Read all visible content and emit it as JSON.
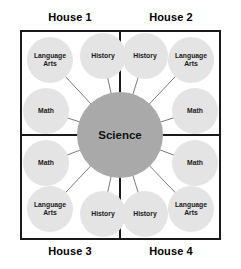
{
  "diagram": {
    "center": {
      "label": "Science",
      "color": "#a9a9a9"
    },
    "satellite_color": "#e4e4e4",
    "border_color": "#1a1a1a",
    "quadrant_labels": {
      "top_left": "House 1",
      "top_right": "House 2",
      "bottom_left": "House 3",
      "bottom_right": "House 4"
    },
    "nodes": [
      {
        "label": "Language Arts",
        "line1": "Language",
        "line2": "Arts",
        "quadrant": "House 1",
        "x": 27,
        "y": 37
      },
      {
        "label": "History",
        "line1": "History",
        "line2": "",
        "quadrant": "House 1",
        "x": 80,
        "y": 33
      },
      {
        "label": "Math",
        "line1": "Math",
        "line2": "",
        "quadrant": "House 1",
        "x": 23,
        "y": 88
      },
      {
        "label": "History",
        "line1": "History",
        "line2": "",
        "quadrant": "House 2",
        "x": 122,
        "y": 33
      },
      {
        "label": "Language Arts",
        "line1": "Language",
        "line2": "Arts",
        "quadrant": "House 2",
        "x": 168,
        "y": 37
      },
      {
        "label": "Math",
        "line1": "Math",
        "line2": "",
        "quadrant": "House 2",
        "x": 172,
        "y": 88
      },
      {
        "label": "Math",
        "line1": "Math",
        "line2": "",
        "quadrant": "House 3",
        "x": 23,
        "y": 140
      },
      {
        "label": "Language Arts",
        "line1": "Language",
        "line2": "Arts",
        "quadrant": "House 3",
        "x": 27,
        "y": 186
      },
      {
        "label": "History",
        "line1": "History",
        "line2": "",
        "quadrant": "House 3",
        "x": 80,
        "y": 191
      },
      {
        "label": "History",
        "line1": "History",
        "line2": "",
        "quadrant": "House 4",
        "x": 122,
        "y": 191
      },
      {
        "label": "Language Arts",
        "line1": "Language",
        "line2": "Arts",
        "quadrant": "House 4",
        "x": 168,
        "y": 186
      },
      {
        "label": "Math",
        "line1": "Math",
        "line2": "",
        "quadrant": "House 4",
        "x": 172,
        "y": 140
      }
    ]
  }
}
